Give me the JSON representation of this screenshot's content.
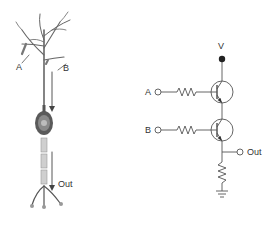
{
  "neuron": {
    "input_a_label": "A",
    "input_b_label": "B",
    "output_label": "Out"
  },
  "circuit": {
    "supply_label": "V",
    "input_a_label": "A",
    "input_b_label": "B",
    "output_label": "Out",
    "components": [
      "resistor-A",
      "transistor-Q1",
      "resistor-B",
      "transistor-Q2",
      "pull-down-resistor",
      "ground"
    ]
  },
  "colors": {
    "line": "#555555",
    "neuron_dark": "#444444",
    "neuron_light": "#bbbbbb",
    "text": "#333333"
  }
}
